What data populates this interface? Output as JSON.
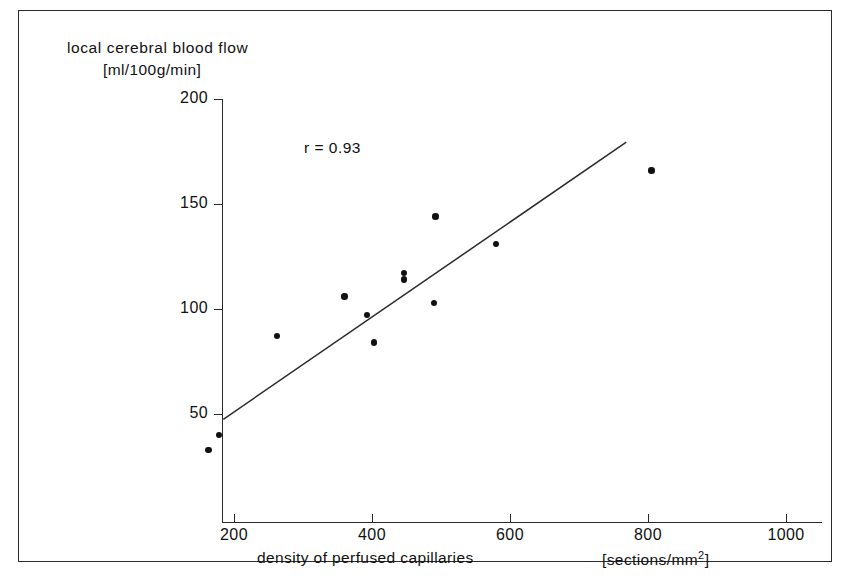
{
  "chart_data": {
    "type": "scatter",
    "title": "",
    "ylabel": "local  cerebral  blood  flow",
    "ylabel_units": "[ml/100g/min]",
    "xlabel": "density of perfused capillaries",
    "xlabel_units": "[sections/mm2]",
    "xlabel_units_base": "[sections/mm",
    "xlabel_units_exp": "2",
    "xlabel_units_close": "]",
    "annotation": "r = 0.93",
    "correlation_r": 0.93,
    "xlim": [
      100,
      1060
    ],
    "ylim": [
      0,
      215
    ],
    "xticks": [
      200,
      400,
      600,
      800,
      1000
    ],
    "yticks": [
      50,
      100,
      150,
      200
    ],
    "xtick_labels": [
      "200",
      "400",
      "600",
      "800",
      "1000"
    ],
    "ytick_labels": [
      "50",
      "100",
      "150",
      "200"
    ],
    "grid": false,
    "legend": false,
    "marker": "filled-circle",
    "marker_color": "#111111",
    "line_color": "#2b2b2b",
    "points": [
      {
        "x": 163,
        "y": 33
      },
      {
        "x": 178,
        "y": 40
      },
      {
        "x": 262,
        "y": 87
      },
      {
        "x": 360,
        "y": 106
      },
      {
        "x": 393,
        "y": 97
      },
      {
        "x": 403,
        "y": 84
      },
      {
        "x": 446,
        "y": 117
      },
      {
        "x": 446,
        "y": 114
      },
      {
        "x": 490,
        "y": 103
      },
      {
        "x": 492,
        "y": 144
      },
      {
        "x": 580,
        "y": 131
      },
      {
        "x": 805,
        "y": 166
      }
    ],
    "trendline": {
      "x1": 186,
      "y1": 47,
      "x2": 770,
      "y2": 179
    }
  },
  "figure": {
    "frame_color": "#2b2b2b",
    "background": "#ffffff"
  }
}
